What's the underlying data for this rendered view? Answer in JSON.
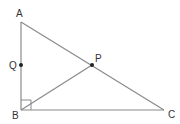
{
  "diagram": {
    "type": "geometry-triangle",
    "colors": {
      "line": "#8a8a8a",
      "point": "#222222",
      "label": "#333333"
    },
    "points": {
      "A": {
        "label": "A",
        "x": 21,
        "y": 22
      },
      "B": {
        "label": "B",
        "x": 21,
        "y": 110
      },
      "C": {
        "label": "C",
        "x": 164,
        "y": 110
      },
      "P": {
        "label": "P",
        "x": 92,
        "y": 65
      },
      "Q": {
        "label": "Q",
        "x": 21,
        "y": 65
      }
    },
    "segments": [
      "AB",
      "BC",
      "CA",
      "BP"
    ],
    "right_angle_at": "B",
    "marked_points": [
      "P",
      "Q"
    ]
  }
}
